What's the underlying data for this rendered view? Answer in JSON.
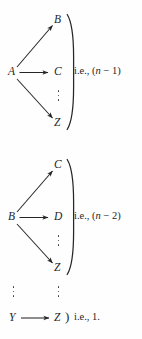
{
  "figure": {
    "type": "math-diagram",
    "background_color": "#fefefe",
    "ink_color": "#262626"
  },
  "blocks": [
    {
      "id": "block-1",
      "source": "A",
      "targets": [
        "B",
        "C",
        "Z"
      ],
      "has_vertical_dots": true,
      "annotation": {
        "prefix": "i.e.,",
        "expression_open": "(",
        "variable": "n",
        "operator": "−",
        "number": "1",
        "expression_close": ")",
        "full": "i.e., (n − 1)"
      }
    },
    {
      "id": "block-2",
      "source": "B",
      "targets": [
        "C",
        "D",
        "Z"
      ],
      "has_vertical_dots": true,
      "annotation": {
        "prefix": "i.e.,",
        "expression_open": "(",
        "variable": "n",
        "operator": "−",
        "number": "2",
        "expression_close": ")",
        "full": "i.e., (n − 2)"
      }
    }
  ],
  "ellipsis_row": {
    "id": "ellipsis-row",
    "left_dots": "⋮",
    "right_dots": "⋮"
  },
  "final_row": {
    "id": "block-final",
    "source": "Y",
    "target": "Z",
    "paren": ")",
    "annotation": {
      "prefix": "i.e.,",
      "number": "1.",
      "full": "i.e., 1."
    }
  },
  "labels": {
    "b1_target_up": "B",
    "b1_target_mid": "C",
    "b1_target_down": "Z",
    "b1_source": "A",
    "b1_note": "i.e., (",
    "b1_note_var": "n",
    "b1_note_tail": " − 1)",
    "b2_target_up": "C",
    "b2_target_mid": "D",
    "b2_target_down": "Z",
    "b2_source": "B",
    "b2_note": "i.e., (",
    "b2_note_var": "n",
    "b2_note_tail": " − 2)",
    "f_source": "Y",
    "f_target": "Z",
    "f_paren": ")",
    "f_note": "i.e., 1."
  }
}
